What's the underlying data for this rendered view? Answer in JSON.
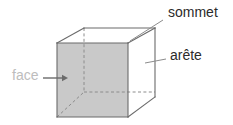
{
  "figure": {
    "shape": "cube",
    "background_color": "#ffffff",
    "face_fill_color": "#c9c9c9",
    "edge_color": "#6b6b6b",
    "hidden_edge_color": "#8c8c8c",
    "leader_line_color": "#8c8c8c"
  },
  "labels": {
    "vertex": {
      "text": "sommet",
      "color": "#2b2b2b",
      "font_size_px": 14,
      "x": 168,
      "y": 7,
      "leader_from_x": 163,
      "leader_from_y": 20,
      "leader_to_x": 130,
      "leader_to_y": 41
    },
    "edge": {
      "text": "arête",
      "color": "#2b2b2b",
      "font_size_px": 14,
      "x": 170,
      "y": 50,
      "leader_from_x": 166,
      "leader_from_y": 59,
      "leader_to_x": 145,
      "leader_to_y": 63
    },
    "face": {
      "text": "face",
      "color": "#bdbdbd",
      "font_size_px": 14,
      "x": 12,
      "y": 70,
      "arrow_from_x": 43,
      "arrow_from_y": 78,
      "arrow_to_x": 68,
      "arrow_to_y": 78
    }
  },
  "geometry": {
    "front_face": {
      "name": "face avant",
      "points": "57,43 128,43 128,117 57,117"
    },
    "top_face": {
      "name": "face superieure",
      "points": "57,43 84,28 155,28 128,43"
    },
    "right_face": {
      "name": "face droite",
      "points": "128,43 155,28 155,97 128,117"
    },
    "visible_edges": [
      {
        "name": "front-top",
        "x1": 57,
        "y1": 43,
        "x2": 128,
        "y2": 43
      },
      {
        "name": "front-right",
        "x1": 128,
        "y1": 43,
        "x2": 128,
        "y2": 117
      },
      {
        "name": "front-bottom",
        "x1": 57,
        "y1": 117,
        "x2": 128,
        "y2": 117
      },
      {
        "name": "front-left",
        "x1": 57,
        "y1": 43,
        "x2": 57,
        "y2": 117
      },
      {
        "name": "top-left-diagonal",
        "x1": 57,
        "y1": 43,
        "x2": 84,
        "y2": 28
      },
      {
        "name": "top-right-diagonal",
        "x1": 128,
        "y1": 43,
        "x2": 155,
        "y2": 28
      },
      {
        "name": "back-top",
        "x1": 84,
        "y1": 28,
        "x2": 155,
        "y2": 28
      },
      {
        "name": "back-right-vertical",
        "x1": 155,
        "y1": 28,
        "x2": 155,
        "y2": 97
      },
      {
        "name": "bottom-right-diagonal",
        "x1": 128,
        "y1": 117,
        "x2": 155,
        "y2": 97
      }
    ],
    "hidden_edges": [
      {
        "name": "back-left-vertical",
        "x1": 84,
        "y1": 28,
        "x2": 84,
        "y2": 92
      },
      {
        "name": "back-bottom",
        "x1": 84,
        "y1": 92,
        "x2": 155,
        "y2": 92
      },
      {
        "name": "bottom-left-diagonal",
        "x1": 57,
        "y1": 117,
        "x2": 84,
        "y2": 92
      }
    ],
    "vertices": [
      {
        "name": "front-top-left",
        "x": 57,
        "y": 43
      },
      {
        "name": "front-top-right",
        "x": 128,
        "y": 43
      },
      {
        "name": "front-bottom-right",
        "x": 128,
        "y": 117
      },
      {
        "name": "front-bottom-left",
        "x": 57,
        "y": 117
      },
      {
        "name": "back-top-left",
        "x": 84,
        "y": 28
      },
      {
        "name": "back-top-right",
        "x": 155,
        "y": 28
      },
      {
        "name": "back-bottom-right",
        "x": 155,
        "y": 97
      },
      {
        "name": "back-bottom-left",
        "x": 84,
        "y": 92
      }
    ]
  }
}
